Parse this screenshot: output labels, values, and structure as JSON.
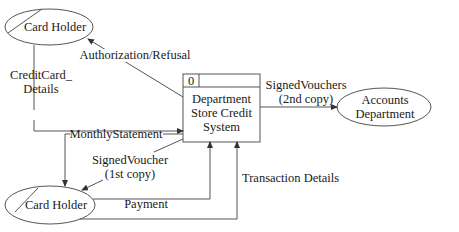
{
  "diagram": {
    "type": "data-flow-diagram",
    "colors": {
      "line": "#555555",
      "text": "#1a1a1a",
      "background": "#ffffff"
    },
    "process": {
      "id": "0",
      "lines": [
        "Department",
        "Store Credit",
        "System"
      ]
    },
    "entities": {
      "card_holder_top": {
        "label": "Card Holder"
      },
      "accounts_department": {
        "lines": [
          "Accounts",
          "Department"
        ]
      },
      "card_holder_bottom": {
        "label": "Card Holder"
      }
    },
    "flows": {
      "authorization": {
        "label": "Authorization/Refusal"
      },
      "credit_card_details": {
        "lines": [
          "CreditCard_",
          "Details"
        ]
      },
      "signed_vouchers_2nd": {
        "lines": [
          "SignedVouchers",
          "(2nd copy)"
        ]
      },
      "monthly_statement": {
        "label": "MonthlyStatement"
      },
      "signed_voucher_1st": {
        "lines": [
          "SignedVoucher",
          "(1st copy)"
        ]
      },
      "payment": {
        "label": "Payment"
      },
      "transaction_details": {
        "label": "Transaction Details"
      }
    }
  }
}
